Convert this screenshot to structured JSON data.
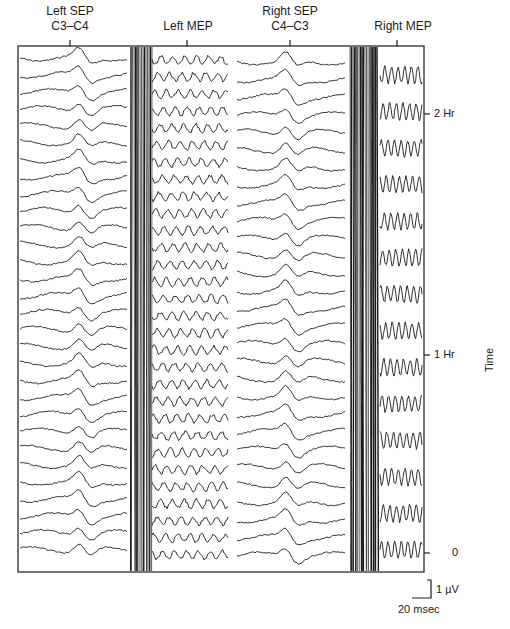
{
  "chart_data": {
    "type": "line",
    "title": "",
    "panels": [
      {
        "id": "left_sep",
        "title_line1": "Left SEP",
        "title_line2": "C3–C4",
        "trace_count": 30,
        "kind": "sep"
      },
      {
        "id": "left_mep",
        "title_line1": "Left MEP",
        "title_line2": "",
        "trace_count": 30,
        "kind": "mep"
      },
      {
        "id": "right_sep",
        "title_line1": "Right SEP",
        "title_line2": "C4–C3",
        "trace_count": 29,
        "kind": "sep"
      },
      {
        "id": "right_mep",
        "title_line1": "Right MEP",
        "title_line2": "",
        "trace_count": 14,
        "kind": "mep"
      }
    ],
    "y_axis": {
      "label": "Time",
      "ticks": [
        {
          "label": "0",
          "y_px": 553
        },
        {
          "label": "1 Hr",
          "y_px": 355
        },
        {
          "label": "2 Hr",
          "y_px": 114
        }
      ],
      "position": "right"
    },
    "scale_bar": {
      "amplitude_label": "1 µV",
      "time_label": "20 msec"
    },
    "grid": false,
    "legend": null
  },
  "labels": {
    "left_sep_1": "Left SEP",
    "left_sep_2": "C3–C4",
    "left_mep": "Left MEP",
    "right_sep_1": "Right SEP",
    "right_sep_2": "C4–C3",
    "right_mep": "Right MEP",
    "tick_2hr": "2 Hr",
    "tick_1hr": "1 Hr",
    "tick_0": "0",
    "time_axis": "Time",
    "scale_uv": "1 µV",
    "scale_ms": "20 msec"
  }
}
